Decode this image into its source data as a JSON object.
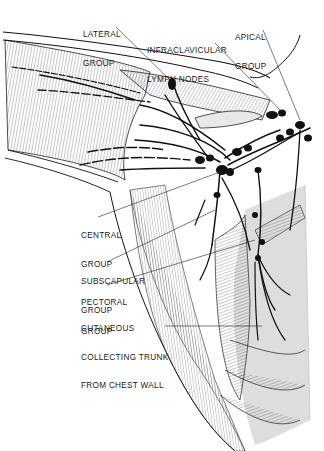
{
  "figure": {
    "labels": {
      "lateral_group": [
        "LATERAL",
        "GROUP"
      ],
      "infraclavicular": [
        "INFRACLAVICULAR",
        "LYMPH NODES"
      ],
      "apical_group": [
        "APICAL",
        "GROUP"
      ],
      "central_group": [
        "CENTRAL",
        "GROUP"
      ],
      "subscapular_group": [
        "SUBSCAPULAR",
        "GROUP"
      ],
      "pectoral_group": [
        "PECTORAL",
        "GROUP"
      ],
      "cutaneous_trunk": [
        "CUTANEOUS",
        "COLLECTING TRUNK",
        "FROM CHEST WALL"
      ]
    },
    "colors": {
      "ink": "#111111",
      "hatch": "#555555",
      "shade": "#d9d9d9",
      "background": "#ffffff"
    }
  }
}
